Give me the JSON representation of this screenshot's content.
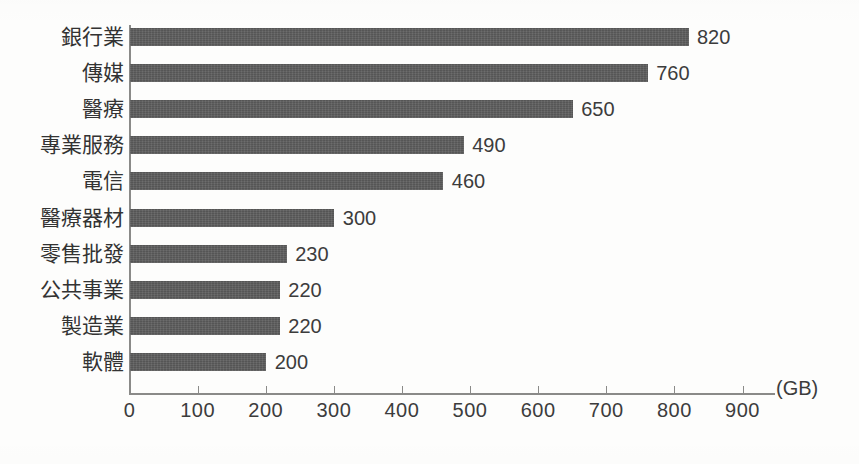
{
  "chart_data": {
    "type": "bar",
    "orientation": "horizontal",
    "title": "",
    "subtitle": "",
    "xlabel": "(GB)",
    "ylabel": "",
    "unit": "(GB)",
    "xlim": [
      0,
      900
    ],
    "xticks": [
      0,
      100,
      200,
      300,
      400,
      500,
      600,
      700,
      800,
      900
    ],
    "xtick_labels": [
      "0",
      "100",
      "200",
      "300",
      "400",
      "500",
      "600",
      "700",
      "800",
      "900"
    ],
    "grid": false,
    "legend": null,
    "bar_color": "#5e5e5e",
    "axis_color": "#8a8a88",
    "text_color": "#3c3c3c",
    "background": "#fdfdfc",
    "categories": [
      "銀行業",
      "傳媒",
      "醫療",
      "專業服務",
      "電信",
      "醫療器材",
      "零售批發",
      "公共事業",
      "製造業",
      "軟體"
    ],
    "values": [
      820,
      760,
      650,
      490,
      460,
      300,
      230,
      220,
      220,
      200
    ],
    "value_labels": [
      "820",
      "760",
      "650",
      "490",
      "460",
      "300",
      "230",
      "220",
      "220",
      "200"
    ]
  }
}
